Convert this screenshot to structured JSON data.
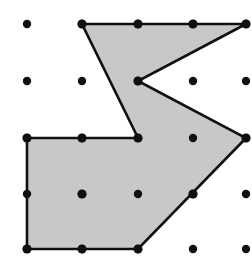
{
  "figure": {
    "title": "Geoboard polygon on 5 by 5 dot lattice",
    "canvas": {
      "width": 252,
      "height": 258,
      "background": "#ffffff"
    },
    "grid": {
      "name": "dot-lattice",
      "columns": 5,
      "rows": 5,
      "x_positions": [
        27,
        82,
        138,
        193,
        246
      ],
      "y_positions": [
        24,
        81,
        138,
        194,
        249
      ],
      "spacing_x": 55,
      "spacing_y": 56,
      "dot_radius": 4.2,
      "dot_color": "#101010",
      "points": [
        {
          "col": 0,
          "row": 0,
          "x": 27,
          "y": 24
        },
        {
          "col": 1,
          "row": 0,
          "x": 82,
          "y": 24
        },
        {
          "col": 2,
          "row": 0,
          "x": 138,
          "y": 24
        },
        {
          "col": 3,
          "row": 0,
          "x": 193,
          "y": 24
        },
        {
          "col": 4,
          "row": 0,
          "x": 246,
          "y": 24
        },
        {
          "col": 0,
          "row": 1,
          "x": 27,
          "y": 81
        },
        {
          "col": 1,
          "row": 1,
          "x": 82,
          "y": 81
        },
        {
          "col": 2,
          "row": 1,
          "x": 138,
          "y": 81
        },
        {
          "col": 3,
          "row": 1,
          "x": 193,
          "y": 81
        },
        {
          "col": 4,
          "row": 1,
          "x": 246,
          "y": 81
        },
        {
          "col": 0,
          "row": 2,
          "x": 27,
          "y": 138
        },
        {
          "col": 1,
          "row": 2,
          "x": 82,
          "y": 138
        },
        {
          "col": 2,
          "row": 2,
          "x": 138,
          "y": 138
        },
        {
          "col": 3,
          "row": 2,
          "x": 193,
          "y": 138
        },
        {
          "col": 4,
          "row": 2,
          "x": 246,
          "y": 138
        },
        {
          "col": 0,
          "row": 3,
          "x": 27,
          "y": 194
        },
        {
          "col": 1,
          "row": 3,
          "x": 82,
          "y": 194
        },
        {
          "col": 2,
          "row": 3,
          "x": 138,
          "y": 194
        },
        {
          "col": 3,
          "row": 3,
          "x": 193,
          "y": 194
        },
        {
          "col": 4,
          "row": 3,
          "x": 246,
          "y": 194
        },
        {
          "col": 0,
          "row": 4,
          "x": 27,
          "y": 249
        },
        {
          "col": 1,
          "row": 4,
          "x": 82,
          "y": 249
        },
        {
          "col": 2,
          "row": 4,
          "x": 138,
          "y": 249
        },
        {
          "col": 3,
          "row": 4,
          "x": 193,
          "y": 249
        },
        {
          "col": 4,
          "row": 4,
          "x": 246,
          "y": 249
        }
      ]
    },
    "polygon": {
      "name": "shaded-polygon",
      "fill_color": "#c8c8c8",
      "stroke_color": "#101010",
      "stroke_width": 2.6,
      "vertex_count": 8,
      "vertices": [
        {
          "label": "A",
          "x": 82,
          "y": 24,
          "grid": "col1,row0"
        },
        {
          "label": "B",
          "x": 246,
          "y": 24,
          "grid": "col4,row0"
        },
        {
          "label": "C",
          "x": 138,
          "y": 81,
          "grid": "col2,row1"
        },
        {
          "label": "D",
          "x": 246,
          "y": 138,
          "grid": "col4,row2"
        },
        {
          "label": "E",
          "x": 138,
          "y": 249,
          "grid": "col2,row4"
        },
        {
          "label": "F",
          "x": 27,
          "y": 249,
          "grid": "col0,row4"
        },
        {
          "label": "G",
          "x": 27,
          "y": 138,
          "grid": "col0,row2"
        },
        {
          "label": "H",
          "x": 138,
          "y": 138,
          "grid": "col2,row2"
        }
      ],
      "path": "M 82,24 L 246,24 L 138,81 L 246,138 L 138,249 L 27,249 L 27,138 L 138,138 Z"
    },
    "vertex_markers": {
      "name": "polygon-vertex-dots",
      "radius": 4.6,
      "color": "#101010"
    },
    "edge_markers": {
      "name": "on-edge-lattice-dots",
      "description": "Lattice dots that lie on polygon edges",
      "points": [
        {
          "x": 138,
          "y": 24
        },
        {
          "x": 193,
          "y": 24
        },
        {
          "x": 82,
          "y": 138
        },
        {
          "x": 82,
          "y": 194
        },
        {
          "x": 193,
          "y": 194
        },
        {
          "x": 82,
          "y": 249
        }
      ]
    }
  }
}
